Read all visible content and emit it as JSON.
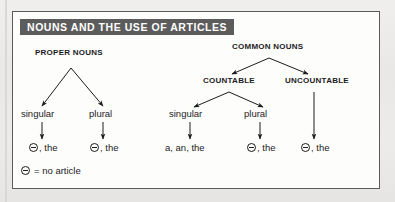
{
  "figure": {
    "title": "NOUNS AND THE USE OF ARTICLES",
    "title_bg_color": "#5c5c5c",
    "title_text_color": "#ffffff",
    "box_bg_color": "#fdfdfc",
    "box_border_color": "#5b5b5b",
    "page_bg_color": "#ebebe9",
    "ink_color": "#1c1c1c"
  },
  "diagram": {
    "type": "tree",
    "roots": [
      {
        "id": "proper-nouns",
        "label": "PROPER NOUNS",
        "children": [
          "proper-singular",
          "proper-plural"
        ]
      },
      {
        "id": "common-nouns",
        "label": "COMMON NOUNS",
        "children": [
          "countable",
          "uncountable"
        ]
      }
    ],
    "levels": [
      {
        "name": "noun-type",
        "nodes": [
          {
            "id": "proper-nouns",
            "label": "PROPER NOUNS"
          },
          {
            "id": "common-nouns",
            "label": "COMMON NOUNS"
          }
        ]
      },
      {
        "name": "countability",
        "nodes": [
          {
            "id": "countable",
            "label": "COUNTABLE",
            "parent": "common-nouns"
          },
          {
            "id": "uncountable",
            "label": "UNCOUNTABLE",
            "parent": "common-nouns"
          }
        ]
      },
      {
        "name": "number",
        "nodes": [
          {
            "id": "proper-singular",
            "label": "singular",
            "parent": "proper-nouns"
          },
          {
            "id": "proper-plural",
            "label": "plural",
            "parent": "proper-nouns"
          },
          {
            "id": "countable-singular",
            "label": "singular",
            "parent": "countable"
          },
          {
            "id": "countable-plural",
            "label": "plural",
            "parent": "countable"
          }
        ]
      },
      {
        "name": "articles",
        "nodes": [
          {
            "id": "art-proper-singular",
            "label": ", the",
            "symbol": "no-article",
            "parent": "proper-singular"
          },
          {
            "id": "art-proper-plural",
            "label": ", the",
            "symbol": "no-article",
            "parent": "proper-plural"
          },
          {
            "id": "art-countable-singular",
            "label": "a, an, the",
            "symbol": "none",
            "parent": "countable-singular"
          },
          {
            "id": "art-countable-plural",
            "label": ", the",
            "symbol": "no-article",
            "parent": "countable-plural"
          },
          {
            "id": "art-uncountable",
            "label": ", the",
            "symbol": "no-article",
            "parent": "uncountable"
          }
        ]
      }
    ]
  },
  "labels": {
    "proper_nouns": "PROPER NOUNS",
    "common_nouns": "COMMON NOUNS",
    "countable": "COUNTABLE",
    "uncountable": "UNCOUNTABLE",
    "proper_singular": "singular",
    "proper_plural": "plural",
    "countable_singular": "singular",
    "countable_plural": "plural"
  },
  "articles": {
    "proper_singular": ", the",
    "proper_plural": ", the",
    "countable_singular": "a, an, the",
    "countable_plural": ", the",
    "uncountable": ", the"
  },
  "legend": {
    "text": "= no article",
    "symbol_name": "no-article-symbol"
  }
}
